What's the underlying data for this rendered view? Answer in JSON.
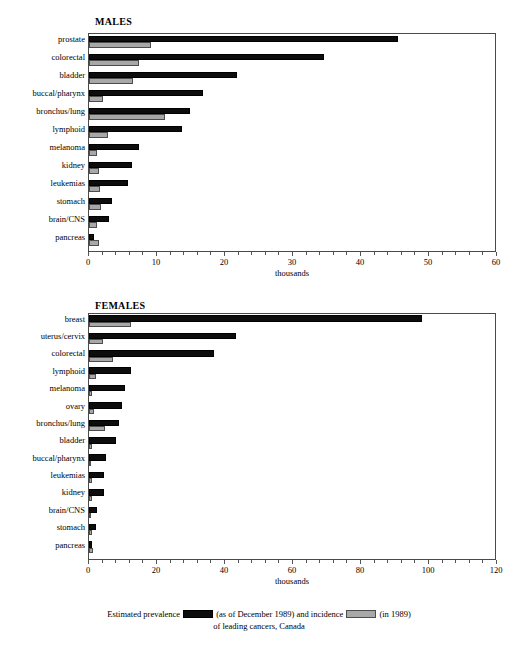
{
  "figure": {
    "caption_line1_part1": "Estimated prevalence",
    "caption_line1_part2": "(as of December 1989) and incidence",
    "caption_line1_part3": "(in 1989)",
    "caption_line2": "of leading cancers, Canada",
    "legend": {
      "prevalence_swatch": "black-swatch",
      "incidence_swatch": "gray-swatch"
    },
    "colors": {
      "prevalence": "#0d0d0d",
      "incidence": "#a8a8a8",
      "axis": "#4a4a4a"
    }
  },
  "chart_data": [
    {
      "type": "bar",
      "orientation": "horizontal",
      "title": "MALES",
      "xlabel": "thousands",
      "ylabel": "",
      "xlim": [
        0,
        60
      ],
      "xticks": [
        0,
        10,
        20,
        30,
        40,
        50,
        60
      ],
      "xticklabels": [
        "0",
        "10",
        "20",
        "30",
        "40",
        "50",
        "60"
      ],
      "minor_tick_step": 2,
      "grid": false,
      "legend_position": "below-figure",
      "categories": [
        "prostate",
        "colorectal",
        "bladder",
        "buccal/pharynx",
        "bronchus/lung",
        "lymphoid",
        "melanoma",
        "kidney",
        "leukemias",
        "stomach",
        "brain/CNS",
        "pancreas"
      ],
      "series": [
        {
          "name": "Estimated prevalence (as of December 1989)",
          "values": [
            45.4,
            34.6,
            21.8,
            16.8,
            14.9,
            13.7,
            7.3,
            6.3,
            5.8,
            3.4,
            2.9,
            0.8
          ]
        },
        {
          "name": "Incidence (in 1989)",
          "values": [
            9.1,
            7.4,
            6.4,
            2.0,
            11.2,
            2.8,
            1.2,
            1.4,
            1.6,
            1.7,
            1.2,
            1.5
          ]
        }
      ]
    },
    {
      "type": "bar",
      "orientation": "horizontal",
      "title": "FEMALES",
      "xlabel": "thousands",
      "ylabel": "",
      "xlim": [
        0,
        120
      ],
      "xticks": [
        0,
        20,
        40,
        60,
        80,
        100,
        120
      ],
      "xticklabels": [
        "0",
        "20",
        "40",
        "60",
        "80",
        "100",
        "120"
      ],
      "minor_tick_step": 4,
      "grid": false,
      "legend_position": "below-figure",
      "categories": [
        "breast",
        "uterus/cervix",
        "colorectal",
        "lymphoid",
        "melanoma",
        "ovary",
        "bronchus/lung",
        "bladder",
        "buccal/pharynx",
        "leukemias",
        "kidney",
        "brain/CNS",
        "stomach",
        "pancreas"
      ],
      "series": [
        {
          "name": "Estimated prevalence (as of December 1989)",
          "values": [
            97.8,
            43.2,
            36.8,
            12.4,
            10.6,
            9.8,
            8.8,
            7.8,
            5.0,
            4.4,
            4.4,
            2.4,
            2.0,
            0.8
          ]
        },
        {
          "name": "Incidence (in 1989)",
          "values": [
            12.4,
            4.0,
            7.2,
            2.2,
            1.0,
            1.6,
            4.6,
            0.8,
            0.4,
            0.9,
            0.8,
            0.6,
            0.8,
            1.2
          ]
        }
      ]
    }
  ]
}
